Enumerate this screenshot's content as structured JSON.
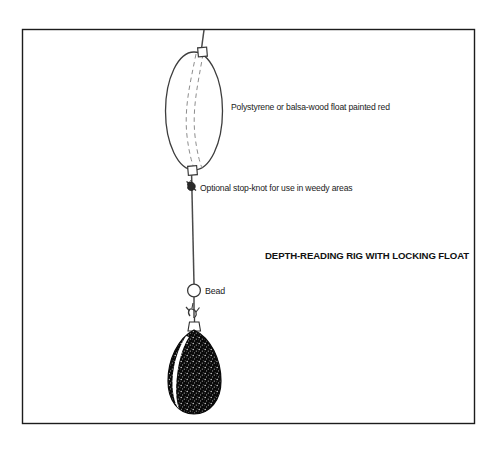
{
  "figure": {
    "title": "DEPTH-READING RIG WITH LOCKING FLOAT",
    "border_color": "#1c1c1c",
    "background_color": "#ffffff",
    "line_color": "#4a4a4a",
    "ink_color": "#1a1a1a"
  },
  "annotations": {
    "float_label": "Polystyrene or balsa-wood float painted red",
    "stopknot_label": "Optional stop-knot for use in weedy areas",
    "bead_label": "Bead"
  },
  "components": {
    "float": {
      "name": "float",
      "shape": "ellipse",
      "fill": "#ffffff",
      "stroke": "#3d3d3d"
    },
    "top_eyelet": {
      "name": "top-eyelet"
    },
    "bottom_eyelet": {
      "name": "bottom-eyelet"
    },
    "stop_knot": {
      "name": "stop-knot"
    },
    "bead": {
      "name": "bead",
      "fill": "#ffffff"
    },
    "swivel": {
      "name": "swivel-loop"
    },
    "weight": {
      "name": "lead-weight",
      "shape": "teardrop",
      "fill": "#0a0a0a",
      "highlight": "#ffffff"
    },
    "main_line": {
      "name": "fishing-line"
    }
  }
}
